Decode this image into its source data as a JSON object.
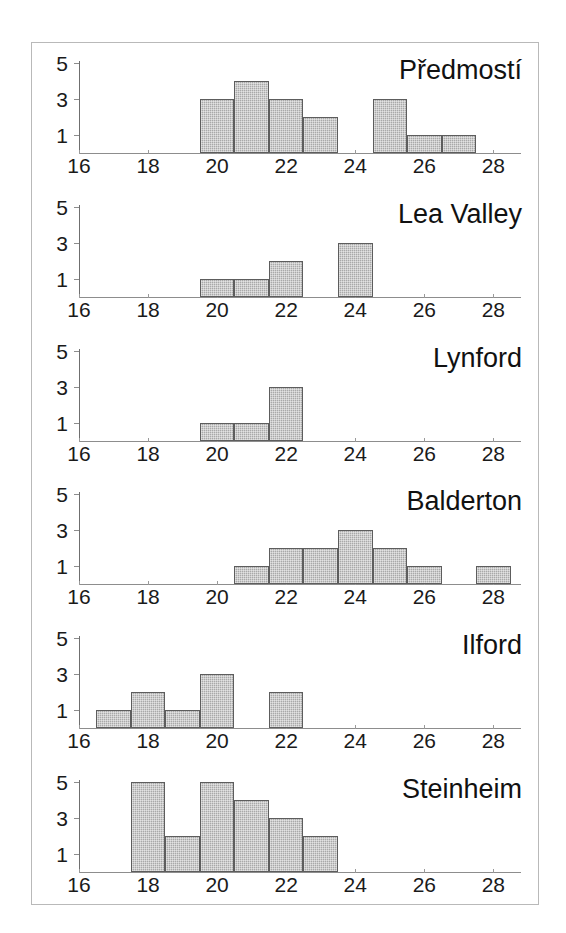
{
  "chart_data": {
    "type": "bar",
    "title": "",
    "xlabel": "",
    "ylabel": "",
    "xlim": [
      16,
      28.8
    ],
    "ylim": [
      0,
      5
    ],
    "grid": false,
    "legend": "none",
    "xticks": [
      16,
      18,
      20,
      22,
      24,
      26,
      28
    ],
    "xtick_labels": [
      "16",
      "18",
      "20",
      "22",
      "24",
      "26",
      "28"
    ],
    "yticks": [
      1,
      3,
      5
    ],
    "ytick_labels": [
      "1",
      "3",
      "5"
    ],
    "bar_width": 1,
    "bar_color": "#a9a9a9",
    "bar_edge_color": "#5d5d5d",
    "axis_color": "#8d8d8d",
    "frame_color": "#b9b9b9",
    "panels": [
      {
        "title": "Předmostí",
        "centers": [
          20,
          21,
          22,
          23,
          25,
          26,
          27
        ],
        "values": [
          3,
          4,
          3,
          2,
          3,
          1,
          1
        ]
      },
      {
        "title": "Lea Valley",
        "centers": [
          20,
          21,
          22,
          24
        ],
        "values": [
          1,
          1,
          2,
          3
        ]
      },
      {
        "title": "Lynford",
        "centers": [
          20,
          21,
          22
        ],
        "values": [
          1,
          1,
          3
        ]
      },
      {
        "title": "Balderton",
        "centers": [
          21,
          22,
          23,
          24,
          25,
          26,
          28
        ],
        "values": [
          1,
          2,
          2,
          3,
          2,
          1,
          1
        ]
      },
      {
        "title": "Ilford",
        "centers": [
          17,
          18,
          19,
          20,
          22
        ],
        "values": [
          1,
          2,
          1,
          3,
          2
        ]
      },
      {
        "title": "Steinheim",
        "centers": [
          18,
          19,
          20,
          21,
          22,
          23
        ],
        "values": [
          5,
          2,
          5,
          4,
          3,
          2
        ]
      }
    ]
  }
}
